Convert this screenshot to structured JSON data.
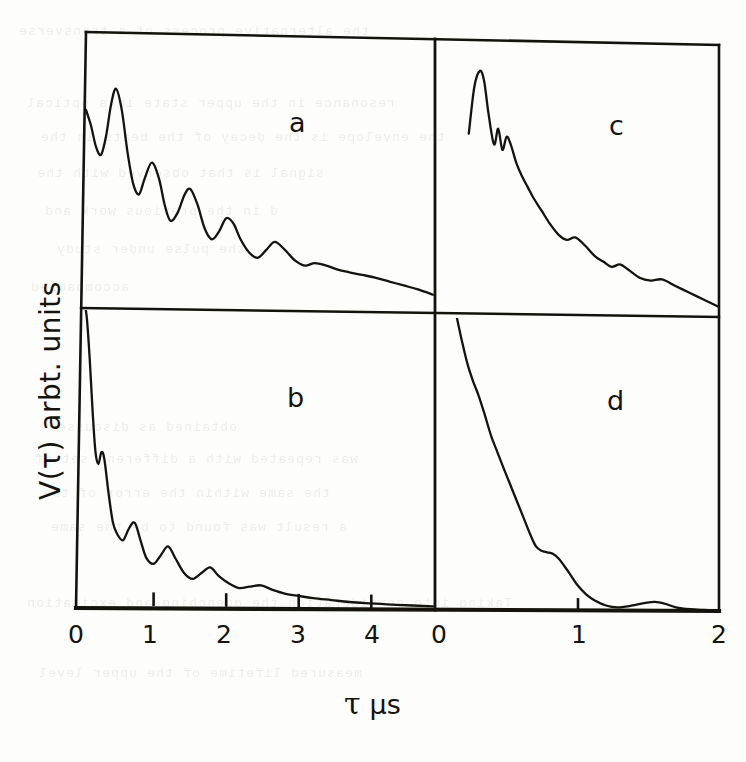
{
  "figure": {
    "kind": "scanned-scientific-figure",
    "background_color": "#fdfdfb",
    "ink_color": "#14130e",
    "y_axis_label": "V(τ) arbt. units",
    "x_axis_symbol": "τ",
    "x_axis_unit": "μs"
  },
  "panels": [
    {
      "id": "a",
      "letter": "a",
      "row": 0,
      "col": 0
    },
    {
      "id": "c",
      "letter": "c",
      "row": 0,
      "col": 1
    },
    {
      "id": "b",
      "letter": "b",
      "row": 1,
      "col": 0
    },
    {
      "id": "d",
      "letter": "d",
      "row": 1,
      "col": 1
    }
  ],
  "axes": {
    "left_column": {
      "tick_labels": [
        "0",
        "1",
        "2",
        "3",
        "4"
      ],
      "tick_values": [
        0,
        1,
        2,
        3,
        4
      ],
      "range": [
        0,
        4.85
      ]
    },
    "right_column": {
      "tick_labels": [
        "0",
        "1",
        "2"
      ],
      "tick_values": [
        0,
        1,
        2
      ],
      "range": [
        0,
        2
      ]
    },
    "y_range": [
      0,
      1
    ]
  },
  "chart_data": {
    "type": "line",
    "title": "",
    "xlabel": "τ μs",
    "ylabel": "V(τ) arbt. units",
    "grid": false,
    "legend": "none",
    "panel_layout": "2x2",
    "panels": [
      {
        "name": "a",
        "xlim": [
          0,
          4.85
        ],
        "ylim": [
          0,
          1
        ],
        "description": "damped oscillatory decay, about eight ripples of decreasing amplitude riding on an exponential envelope",
        "x": [
          0.0,
          0.07,
          0.14,
          0.21,
          0.28,
          0.35,
          0.42,
          0.5,
          0.58,
          0.66,
          0.74,
          0.82,
          0.92,
          1.02,
          1.1,
          1.18,
          1.28,
          1.38,
          1.46,
          1.56,
          1.66,
          1.76,
          1.86,
          1.96,
          2.06,
          2.16,
          2.28,
          2.4,
          2.52,
          2.64,
          2.78,
          2.92,
          3.06,
          3.2,
          3.36,
          3.52,
          3.68,
          3.86,
          4.04,
          4.24,
          4.44,
          4.64,
          4.85
        ],
        "y": [
          0.72,
          0.66,
          0.58,
          0.55,
          0.62,
          0.74,
          0.8,
          0.72,
          0.56,
          0.44,
          0.4,
          0.46,
          0.52,
          0.46,
          0.36,
          0.3,
          0.33,
          0.4,
          0.42,
          0.36,
          0.27,
          0.23,
          0.26,
          0.31,
          0.29,
          0.23,
          0.18,
          0.16,
          0.19,
          0.22,
          0.19,
          0.15,
          0.13,
          0.14,
          0.13,
          0.115,
          0.105,
          0.095,
          0.085,
          0.07,
          0.055,
          0.04,
          0.02
        ]
      },
      {
        "name": "b",
        "xlim": [
          0,
          4.85
        ],
        "ylim": [
          0,
          1
        ],
        "description": "very steep decay clipped at the top of the frame, followed by small damped ripples that reach the baseline near tau = 3",
        "x": [
          0.0,
          0.04,
          0.08,
          0.12,
          0.16,
          0.2,
          0.24,
          0.28,
          0.32,
          0.38,
          0.44,
          0.5,
          0.58,
          0.66,
          0.74,
          0.82,
          0.9,
          1.0,
          1.1,
          1.2,
          1.3,
          1.42,
          1.54,
          1.66,
          1.78,
          1.9,
          2.04,
          2.18,
          2.32,
          2.48,
          2.64,
          2.82,
          3.0,
          3.2,
          3.45,
          3.7,
          4.0,
          4.35,
          4.85
        ],
        "y": [
          1.06,
          1.04,
          0.98,
          0.84,
          0.66,
          0.52,
          0.48,
          0.52,
          0.5,
          0.38,
          0.28,
          0.24,
          0.22,
          0.26,
          0.28,
          0.22,
          0.16,
          0.14,
          0.17,
          0.2,
          0.16,
          0.11,
          0.09,
          0.11,
          0.13,
          0.1,
          0.075,
          0.06,
          0.065,
          0.07,
          0.055,
          0.042,
          0.035,
          0.028,
          0.022,
          0.016,
          0.012,
          0.008,
          0.004
        ]
      },
      {
        "name": "c",
        "xlim": [
          0,
          2
        ],
        "ylim": [
          0,
          1
        ],
        "description": "sharp rise to a peak near tau = 0.3, a small notch shoulder just after the peak, then a smooth irregular decay approaching zero at tau = 2",
        "x": [
          0.22,
          0.26,
          0.3,
          0.33,
          0.36,
          0.4,
          0.43,
          0.46,
          0.49,
          0.52,
          0.56,
          0.6,
          0.64,
          0.68,
          0.74,
          0.8,
          0.86,
          0.92,
          0.98,
          1.05,
          1.12,
          1.18,
          1.24,
          1.3,
          1.36,
          1.44,
          1.52,
          1.6,
          1.7,
          1.8,
          1.9,
          2.0
        ],
        "y": [
          0.66,
          0.84,
          0.9,
          0.86,
          0.74,
          0.62,
          0.68,
          0.6,
          0.65,
          0.62,
          0.55,
          0.5,
          0.46,
          0.42,
          0.37,
          0.32,
          0.28,
          0.26,
          0.27,
          0.24,
          0.2,
          0.18,
          0.16,
          0.17,
          0.15,
          0.12,
          0.11,
          0.115,
          0.09,
          0.065,
          0.04,
          0.015
        ]
      },
      {
        "name": "d",
        "xlim": [
          0,
          2
        ],
        "ylim": [
          0,
          1
        ],
        "description": "steep near-linear descent clipped at the top of the frame, a plateau shoulder near tau = 0.75, drop to baseline by tau = 1.2 and a faint bump near tau = 1.55",
        "x": [
          0.13,
          0.17,
          0.21,
          0.25,
          0.29,
          0.33,
          0.38,
          0.42,
          0.46,
          0.51,
          0.56,
          0.61,
          0.66,
          0.7,
          0.74,
          0.78,
          0.82,
          0.86,
          0.9,
          0.95,
          1.0,
          1.06,
          1.12,
          1.2,
          1.28,
          1.38,
          1.48,
          1.55,
          1.62,
          1.7,
          1.8,
          1.9,
          2.0
        ],
        "y": [
          1.02,
          0.93,
          0.85,
          0.79,
          0.74,
          0.68,
          0.6,
          0.55,
          0.5,
          0.44,
          0.38,
          0.32,
          0.26,
          0.22,
          0.205,
          0.2,
          0.195,
          0.18,
          0.155,
          0.12,
          0.085,
          0.055,
          0.035,
          0.018,
          0.012,
          0.018,
          0.028,
          0.032,
          0.026,
          0.014,
          0.008,
          0.006,
          0.005
        ]
      }
    ]
  },
  "bleed_through_text": {
    "note": "faint mirrored show-through from the reverse side of the printed page",
    "lines": [
      "the alternative process of a transverse",
      "resonance in the upper state in a optical",
      "the envelope is the decay of the beats in the",
      "signal is that observed with the",
      "d in the previous work and",
      "the pulse under study",
      "accompanied",
      "obtained as discussed",
      "was repeated with a different set of",
      "the same within the error of the",
      "a result was found to be the same",
      "Taking into consideration the quenching and excitation",
      "measured lifetime of the upper level"
    ]
  }
}
